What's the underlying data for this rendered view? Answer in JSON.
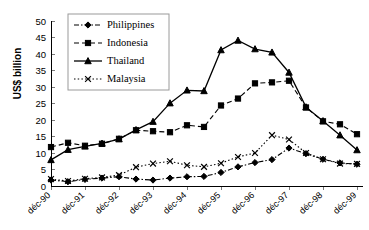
{
  "chart_data": {
    "type": "line",
    "title": "",
    "subtitle": "",
    "xlabel": "",
    "ylabel": "US$ billion",
    "ylim": [
      0,
      50
    ],
    "yticks": [
      0,
      5,
      10,
      15,
      20,
      25,
      30,
      35,
      40,
      45,
      50
    ],
    "ytick_labels": [
      "0",
      "5",
      "10",
      "15",
      "20",
      "25",
      "30",
      "35",
      "40",
      "45",
      "50"
    ],
    "xtick_labels": [
      "déc-90",
      "déc-91",
      "déc-92",
      "déc-93",
      "déc-94",
      "déc-95",
      "déc-96",
      "déc-97",
      "déc-98",
      "déc-99"
    ],
    "x_points": [
      "déc-90",
      "juin-91",
      "déc-91",
      "juin-92",
      "déc-92",
      "juin-93",
      "déc-93",
      "juin-94",
      "déc-94",
      "juin-95",
      "déc-95",
      "juin-96",
      "déc-96",
      "juin-97",
      "déc-97",
      "juin-98",
      "déc-98",
      "juin-99",
      "déc-99"
    ],
    "grid": false,
    "legend_position": "top-left",
    "series": [
      {
        "name": "Philippines",
        "marker": "diamond",
        "linestyle": "dash-dot",
        "values": [
          1.8,
          1.3,
          2.0,
          2.4,
          2.8,
          2.1,
          1.8,
          2.4,
          2.8,
          2.9,
          4.1,
          5.8,
          7.1,
          8.0,
          11.5,
          9.8,
          8.1,
          7.0,
          6.6
        ]
      },
      {
        "name": "Indonesia",
        "marker": "square",
        "linestyle": "dashed",
        "values": [
          11.8,
          13.1,
          12.2,
          12.8,
          14.3,
          16.9,
          16.6,
          16.3,
          18.4,
          17.9,
          24.4,
          26.5,
          31.1,
          31.4,
          31.9,
          23.8,
          19.6,
          18.7,
          15.7
        ]
      },
      {
        "name": "Thailand",
        "marker": "triangle",
        "linestyle": "solid",
        "values": [
          7.9,
          11.0,
          12.0,
          12.9,
          14.2,
          17.0,
          19.5,
          25.1,
          29.0,
          28.8,
          41.2,
          44.1,
          41.5,
          40.5,
          34.4,
          23.9,
          19.7,
          15.4,
          10.9
        ]
      },
      {
        "name": "Malaysia",
        "marker": "x",
        "linestyle": "dotted",
        "values": [
          2.1,
          1.5,
          2.2,
          2.6,
          3.3,
          5.7,
          6.8,
          7.5,
          6.3,
          5.8,
          6.9,
          8.8,
          10.0,
          15.4,
          14.1,
          10.0,
          8.1,
          6.8,
          6.7
        ]
      }
    ]
  },
  "axis": {
    "ylabel": "US$ billion"
  },
  "legend": {
    "items": [
      {
        "label": "Philippines"
      },
      {
        "label": "Indonesia"
      },
      {
        "label": "Thailand"
      },
      {
        "label": "Malaysia"
      }
    ]
  }
}
